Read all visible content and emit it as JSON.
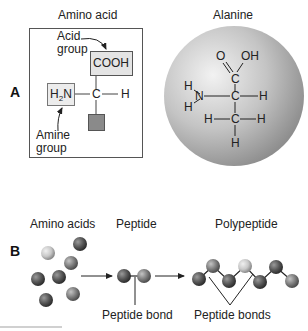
{
  "panel_a": {
    "letter": "A",
    "amino_acid": {
      "title": "Amino acid",
      "acid_group_label_line1": "Acid",
      "acid_group_label_line2": "group",
      "acid_group_formula": "COOH",
      "amine_group_formula_prefix": "H",
      "amine_group_formula_sub": "2",
      "amine_group_formula_suffix": "N",
      "central_atom": "C",
      "side_atom": "H",
      "amine_group_label_line1": "Amine",
      "amine_group_label_line2": "group"
    },
    "alanine": {
      "title": "Alanine",
      "atoms": {
        "o": "O",
        "oh": "OH",
        "c_carboxyl": "C",
        "n": "N",
        "h_n_top": "H",
        "h_n_bottom": "H",
        "c_alpha": "C",
        "h_alpha": "H",
        "c_methyl": "C",
        "h_methyl_left": "H",
        "h_methyl_right": "H",
        "h_methyl_bottom": "H"
      }
    }
  },
  "panel_b": {
    "letter": "B",
    "amino_acids_label": "Amino acids",
    "peptide_label": "Peptide",
    "polypeptide_label": "Polypeptide",
    "peptide_bond_label": "Peptide bond",
    "peptide_bonds_label": "Peptide bonds"
  },
  "colors": {
    "box_fill": "#e4e4e4",
    "side_chain_fill": "#8a8a8a",
    "sphere_light": "#e8e8e8",
    "sphere_dark": "#8c8c8c",
    "line": "#333333"
  }
}
